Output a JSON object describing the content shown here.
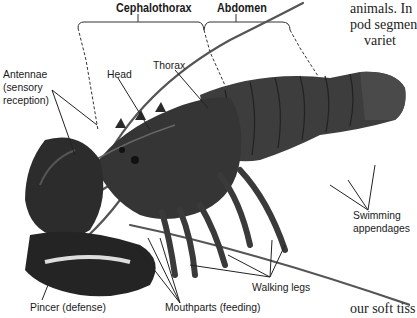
{
  "figure": {
    "region_labels": {
      "cephalothorax": "Cephalothorax",
      "abdomen": "Abdomen"
    },
    "labels": {
      "antennae_line1": "Antennae",
      "antennae_line2": "(sensory",
      "antennae_line3": "reception)",
      "head": "Head",
      "thorax": "Thorax",
      "swimming_line1": "Swimming",
      "swimming_line2": "appendages",
      "walking_legs": "Walking legs",
      "pincer": "Pincer (defense)",
      "mouthparts": "Mouthparts (feeding)"
    },
    "colors": {
      "label_text": "#1a1a1a",
      "lobster_body": "#3a3a3a",
      "lobster_dark": "#1e1e1e",
      "leader_line": "#222222"
    }
  },
  "body_text": {
    "line1": "animals. In",
    "line2": "pod segmen",
    "line3": "variet",
    "line4": "our soft tiss"
  }
}
